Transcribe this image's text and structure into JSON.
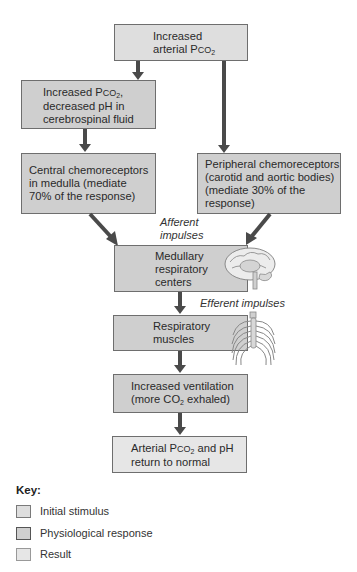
{
  "diagram": {
    "nodes": [
      {
        "id": "n1",
        "type": "initial_stimulus",
        "line1": "Increased",
        "line2_pre": "arterial P",
        "line2_sc": "CO",
        "line2_sub": "2"
      },
      {
        "id": "n2",
        "type": "physiological_response",
        "line1_pre": "Increased P",
        "line1_sc": "CO",
        "line1_sub": "2",
        "line1_post": ",",
        "line2": "decreased pH in",
        "line3": "cerebrospinal fluid"
      },
      {
        "id": "n3",
        "type": "physiological_response",
        "line1": "Central chemoreceptors",
        "line2": "in medulla (mediate",
        "line3": "70% of the response)"
      },
      {
        "id": "n4",
        "type": "physiological_response",
        "line1": "Peripheral chemoreceptors",
        "line2": "(carotid and aortic bodies)",
        "line3": "(mediate 30% of the",
        "line4": "response)"
      },
      {
        "id": "n5",
        "type": "physiological_response",
        "line1": "Medullary",
        "line2": "respiratory",
        "line3": "centers"
      },
      {
        "id": "n6",
        "type": "physiological_response",
        "line1": "Respiratory",
        "line2": "muscles"
      },
      {
        "id": "n7",
        "type": "physiological_response",
        "line1": "Increased ventilation",
        "line2_pre": "(more CO",
        "line2_sub": "2",
        "line2_post": " exhaled)"
      },
      {
        "id": "n8",
        "type": "result",
        "line1_pre": "Arterial P",
        "line1_sc": "CO",
        "line1_sub": "2",
        "line1_post": " and pH",
        "line2": "return to normal"
      }
    ],
    "edges": [
      {
        "from": "n1",
        "to": "n2"
      },
      {
        "from": "n1",
        "to": "n4"
      },
      {
        "from": "n2",
        "to": "n3"
      },
      {
        "from": "n3",
        "to": "n5"
      },
      {
        "from": "n4",
        "to": "n5"
      },
      {
        "from": "n5",
        "to": "n6"
      },
      {
        "from": "n6",
        "to": "n7"
      },
      {
        "from": "n7",
        "to": "n8"
      }
    ],
    "annotations": {
      "afferent_line1": "Afferent",
      "afferent_line2": "impulses",
      "efferent": "Efferent impulses"
    },
    "illustrations": [
      "brain-illustration",
      "rib-cage-illustration"
    ]
  },
  "key": {
    "title": "Key:",
    "items": [
      {
        "label": "Initial stimulus",
        "color": "#dedede"
      },
      {
        "label": "Physiological response",
        "color": "#cfcfcf"
      },
      {
        "label": "Result",
        "color": "#e6e6e6"
      }
    ]
  },
  "colors": {
    "initial_stimulus": "#dedede",
    "physiological_response": "#cfcfcf",
    "result": "#e6e6e6",
    "arrow": "#4a4a4a",
    "border": "#6e6e6e"
  }
}
